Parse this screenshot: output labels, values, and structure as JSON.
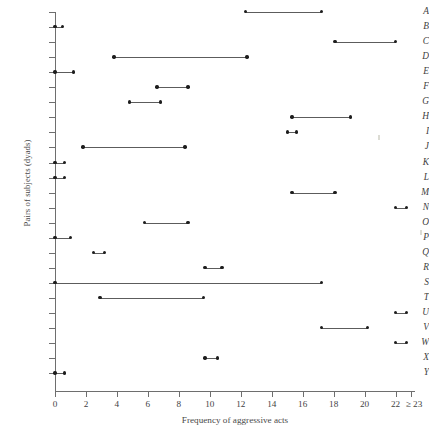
{
  "chart_data": {
    "type": "range_plot",
    "title": "",
    "xlabel": "Frequency of aggressive acts",
    "ylabel": "Pairs of subjects (dyads)",
    "xlim": [
      -0.6,
      23.6
    ],
    "xticks": [
      0,
      2,
      4,
      6,
      8,
      10,
      12,
      14,
      16,
      18,
      20,
      22,
      23
    ],
    "xtick_labels": [
      "0",
      "2",
      "4",
      "6",
      "8",
      "10",
      "12",
      "14",
      "16",
      "18",
      "20",
      "22",
      "≥ 23"
    ],
    "grid": false,
    "legend": null,
    "categories": [
      "A",
      "B",
      "C",
      "D",
      "E",
      "F",
      "G",
      "H",
      "I",
      "J",
      "K",
      "L",
      "M",
      "N",
      "O",
      "P",
      "Q",
      "R",
      "S",
      "T",
      "U",
      "V",
      "W",
      "X",
      "Y"
    ],
    "series": [
      {
        "name": "Range of aggressive acts per dyad",
        "ranges": [
          {
            "category": "A",
            "low": 12.3,
            "high": 17.2
          },
          {
            "category": "B",
            "low": 0.0,
            "high": 0.5
          },
          {
            "category": "C",
            "low": 18.1,
            "high": 22.0
          },
          {
            "category": "D",
            "low": 3.8,
            "high": 12.4
          },
          {
            "category": "E",
            "low": 0.0,
            "high": 1.2
          },
          {
            "category": "F",
            "low": 6.6,
            "high": 8.6
          },
          {
            "category": "G",
            "low": 4.8,
            "high": 6.8
          },
          {
            "category": "H",
            "low": 15.3,
            "high": 19.1
          },
          {
            "category": "I",
            "low": 15.0,
            "high": 15.6
          },
          {
            "category": "J",
            "low": 1.8,
            "high": 8.4
          },
          {
            "category": "K",
            "low": 0.0,
            "high": 0.6
          },
          {
            "category": "L",
            "low": 0.0,
            "high": 0.6
          },
          {
            "category": "M",
            "low": 15.3,
            "high": 18.1
          },
          {
            "category": "N",
            "low": 22.0,
            "high": 22.7
          },
          {
            "category": "O",
            "low": 5.8,
            "high": 8.6
          },
          {
            "category": "P",
            "low": 0.0,
            "high": 1.0
          },
          {
            "category": "Q",
            "low": 2.5,
            "high": 3.2
          },
          {
            "category": "R",
            "low": 9.7,
            "high": 10.8
          },
          {
            "category": "S",
            "low": 0.0,
            "high": 17.2
          },
          {
            "category": "T",
            "low": 2.9,
            "high": 9.6
          },
          {
            "category": "U",
            "low": 22.0,
            "high": 22.7
          },
          {
            "category": "V",
            "low": 17.2,
            "high": 20.2
          },
          {
            "category": "W",
            "low": 22.0,
            "high": 22.7
          },
          {
            "category": "X",
            "low": 9.7,
            "high": 10.5
          },
          {
            "category": "Y",
            "low": 0.0,
            "high": 0.6
          }
        ]
      }
    ]
  },
  "colors": {
    "line": "#5c5c5c",
    "dot": "#1d1d1d",
    "axis": "#6e6e6e",
    "text": "#3f3f3f",
    "background": "#ffffff"
  }
}
